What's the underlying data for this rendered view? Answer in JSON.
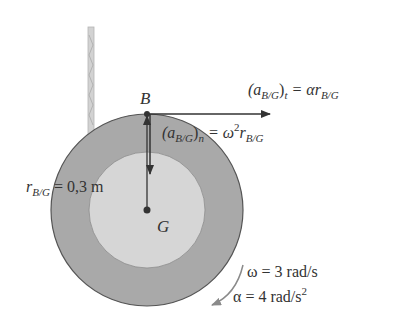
{
  "diagram": {
    "colors": {
      "outer_ring": "#a9a9a9",
      "inner_disc": "#d6d6d6",
      "outline": "#555555",
      "arrow": "#333333",
      "rotation_arrow": "#8a8a8a",
      "rope": "#c8c8c8",
      "text": "#333333"
    },
    "points": {
      "B": {
        "label": "B",
        "x": 147,
        "y": 114
      },
      "G": {
        "label": "G",
        "x": 147,
        "y": 210
      }
    },
    "labels": {
      "tangential": {
        "open": "(a",
        "sub": "B/G",
        "close": ")",
        "close_sub": "t",
        "eq": " = αr",
        "eq_sub": "B/G"
      },
      "normal": {
        "open": "(a",
        "sub": "B/G",
        "close": ")",
        "close_sub": "n",
        "eq": " = ω",
        "sup": "2",
        "eq2": "r",
        "eq_sub": "B/G"
      },
      "radius": {
        "r": "r",
        "sub": "B/G",
        "eq": " = 0,3 m"
      },
      "omega": "ω = 3 rad/s",
      "alpha": {
        "text": "α = 4 rad/s",
        "sup": "2"
      }
    },
    "values": {
      "r_BG_m": 0.3,
      "omega_rad_s": 3,
      "alpha_rad_s2": 4
    }
  }
}
